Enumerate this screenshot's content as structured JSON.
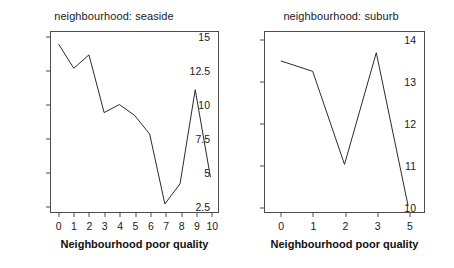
{
  "figure": {
    "background_color": "#ffffff",
    "axis_color": "#4d4d4d",
    "line_color": "#2b2b2b",
    "text_color": "#1a1a1a"
  },
  "panels": [
    {
      "title": "neighbourhood: seaside",
      "xlabel": "Neighbourhood poor quality",
      "xticklabels": [
        "0",
        "1",
        "2",
        "3",
        "4",
        "5",
        "6",
        "7",
        "8",
        "9",
        "10"
      ],
      "yticklabels": [
        "2.5",
        "5",
        "7.5",
        "10",
        "12.5",
        "15"
      ]
    },
    {
      "title": "neighbourhood: suburb",
      "xlabel": "Neighbourhood poor quality",
      "xticklabels": [
        "0",
        "1",
        "2",
        "3",
        "5"
      ],
      "yticklabels": [
        "10",
        "11",
        "12",
        "13",
        "14"
      ]
    }
  ],
  "chart_data": [
    {
      "type": "line",
      "title": "neighbourhood: seaside",
      "xlabel": "Neighbourhood poor quality",
      "ylabel": "",
      "x": [
        0,
        1,
        2,
        3,
        4,
        5,
        6,
        7,
        8,
        9,
        10
      ],
      "values": [
        14.5,
        12.7,
        13.7,
        9.4,
        10.0,
        9.2,
        7.8,
        2.6,
        4.1,
        11.1,
        4.6
      ],
      "xticks": [
        0,
        1,
        2,
        3,
        4,
        5,
        6,
        7,
        8,
        9,
        10
      ],
      "yticks": [
        2.5,
        5,
        7.5,
        10,
        12.5,
        15
      ],
      "xlim": [
        -0.5,
        10.5
      ],
      "ylim": [
        2.0,
        15.4
      ],
      "grid": false,
      "legend": "none"
    },
    {
      "type": "line",
      "title": "neighbourhood: suburb",
      "xlabel": "Neighbourhood poor quality",
      "ylabel": "",
      "categories": [
        "0",
        "1",
        "2",
        "3",
        "5"
      ],
      "x": [
        0,
        1,
        2,
        3,
        5
      ],
      "values": [
        13.5,
        13.25,
        11.0,
        13.7,
        10.0
      ],
      "xticks": [
        0,
        1,
        2,
        3,
        5
      ],
      "yticks": [
        10,
        11,
        12,
        13,
        14
      ],
      "ylim": [
        9.85,
        14.2
      ],
      "grid": false,
      "legend": "none"
    }
  ]
}
